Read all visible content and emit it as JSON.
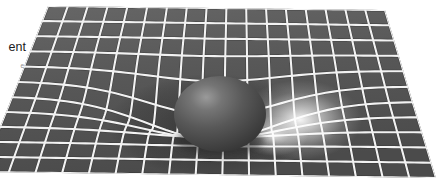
{
  "figure": {
    "width": 444,
    "height": 193,
    "background_color": "#ffffff"
  },
  "caption": {
    "main_text": "ent",
    "main_note": "caption text clipped at left edge of image",
    "sub_text": "e",
    "main_color": "#1b1b1b",
    "sub_color": "#8f8f8f"
  },
  "colors": {
    "sheet_dark": "#4f4f4f",
    "sheet_mid": "#5c5c5c",
    "sheet_light": "#6e6e6e",
    "gridline": "#f2f2f2",
    "gridline_shadow": "#2e2e2e",
    "sphere_dark": "#3b3b3b",
    "sphere_mid": "#585858",
    "sphere_highlight": "#9a9a9a",
    "glow": "#ffffff",
    "background": "#ffffff"
  },
  "scene": {
    "surface_label": "warped-spacetime-grid",
    "sphere_label": "massive-body-sphere",
    "glow_label": "light-glow",
    "grid_columns": 17,
    "grid_rows": 11,
    "sphere_center_x": 220,
    "sphere_center_y": 114,
    "sphere_radius_x": 46,
    "sphere_radius_y": 38,
    "well_center_u": 0.5,
    "well_center_v": 0.52,
    "well_depth": 56,
    "well_radius": 0.33,
    "light_source_x": 300,
    "light_source_y": 120
  }
}
